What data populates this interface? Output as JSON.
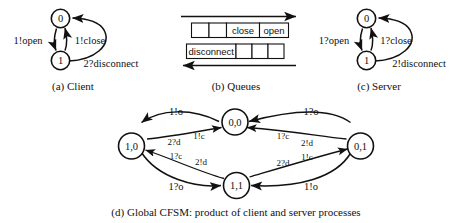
{
  "figure": {
    "background": "#ffffff",
    "ink": "#111111"
  },
  "panels": {
    "client": {
      "caption": "(a) Client",
      "states": [
        {
          "id": "c0",
          "label": "0"
        },
        {
          "id": "c1",
          "label": "1"
        }
      ],
      "transitions": [
        {
          "from": "0",
          "to": "1",
          "label": "1!open"
        },
        {
          "from": "1",
          "to": "0",
          "label": "1!close"
        },
        {
          "from": "1",
          "to": "0",
          "label": "2?disconnect"
        }
      ]
    },
    "queues": {
      "caption": "(b) Queues",
      "top_queue": {
        "direction": "right",
        "cells": [
          "",
          "",
          "close",
          "open"
        ]
      },
      "bottom_queue": {
        "direction": "left",
        "cells": [
          "disconnect",
          "",
          "",
          ""
        ]
      }
    },
    "server": {
      "caption": "(c) Server",
      "states": [
        {
          "id": "s0",
          "label": "0"
        },
        {
          "id": "s1",
          "label": "1"
        }
      ],
      "transitions": [
        {
          "from": "0",
          "to": "1",
          "label": "1?open"
        },
        {
          "from": "1",
          "to": "0",
          "label": "1?close"
        },
        {
          "from": "1",
          "to": "0",
          "label": "2!disconnect"
        }
      ]
    },
    "global": {
      "caption": "(d) Global CFSM: product of client and server processes",
      "states": [
        {
          "id": "g00",
          "label": "0,0"
        },
        {
          "id": "g10",
          "label": "1,0"
        },
        {
          "id": "g01",
          "label": "0,1"
        },
        {
          "id": "g11",
          "label": "1,1"
        }
      ],
      "transitions": [
        {
          "from": "0,0",
          "to": "1,0",
          "label": "1!o"
        },
        {
          "from": "0,1",
          "to": "0,0",
          "label": "1?o"
        },
        {
          "from": "1,0",
          "to": "0,0",
          "label": "1!c"
        },
        {
          "from": "1,0",
          "to": "0,0",
          "label": "2?d"
        },
        {
          "from": "0,1",
          "to": "0,0",
          "label": "1?c"
        },
        {
          "from": "0,1",
          "to": "0,0",
          "label": "2!d"
        },
        {
          "from": "1,1",
          "to": "1,0",
          "label": "1?c"
        },
        {
          "from": "1,1",
          "to": "1,0",
          "label": "2!d"
        },
        {
          "from": "1,1",
          "to": "0,1",
          "label": "2?d"
        },
        {
          "from": "1,1",
          "to": "0,1",
          "label": "1!c"
        },
        {
          "from": "1,0",
          "to": "1,1",
          "label": "1?o"
        },
        {
          "from": "0,1",
          "to": "1,1",
          "label": "1!o"
        }
      ]
    }
  }
}
